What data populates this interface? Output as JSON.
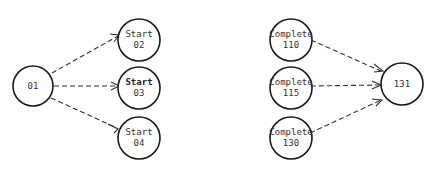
{
  "diagram": {
    "type": "network",
    "nodes": [
      {
        "id": "n01",
        "line1": "01",
        "line2": "",
        "cx": 33,
        "cy": 86
      },
      {
        "id": "n02",
        "line1": "Start",
        "line2": "02",
        "cx": 139,
        "cy": 40
      },
      {
        "id": "n03",
        "line1": "Start",
        "line2": "03",
        "cx": 139,
        "cy": 88
      },
      {
        "id": "n04",
        "line1": "Start",
        "line2": "04",
        "cx": 139,
        "cy": 138
      },
      {
        "id": "n110",
        "line1": "Complete",
        "line2": "110",
        "cx": 291,
        "cy": 40
      },
      {
        "id": "n115",
        "line1": "Complete",
        "line2": "115",
        "cx": 291,
        "cy": 88
      },
      {
        "id": "n130",
        "line1": "Complete",
        "line2": "130",
        "cx": 291,
        "cy": 138
      },
      {
        "id": "n131",
        "line1": "131",
        "line2": "",
        "cx": 402,
        "cy": 84
      }
    ],
    "edges": [
      {
        "from": "01",
        "to": "Start 02"
      },
      {
        "from": "01",
        "to": "Start 03"
      },
      {
        "from": "01",
        "to": "Start 04"
      },
      {
        "from": "Complete 110",
        "to": "131"
      },
      {
        "from": "Complete 115",
        "to": "131"
      },
      {
        "from": "Complete 130",
        "to": "131"
      }
    ]
  }
}
